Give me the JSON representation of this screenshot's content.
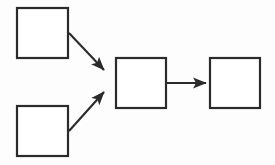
{
  "diagram": {
    "title": "",
    "background_color": "#fdfdfd",
    "stroke_color": "#2b2b2b",
    "fill_color": "#ffffff",
    "type": "flowchart",
    "nodes": [
      {
        "id": "node-top-left",
        "label": "",
        "x": 17,
        "y": 8,
        "width": 51,
        "height": 50
      },
      {
        "id": "node-bottom-left",
        "label": "",
        "x": 17,
        "y": 106,
        "width": 51,
        "height": 50
      },
      {
        "id": "node-middle",
        "label": "",
        "x": 116,
        "y": 58,
        "width": 50,
        "height": 50
      },
      {
        "id": "node-right",
        "label": "",
        "x": 210,
        "y": 58,
        "width": 50,
        "height": 50
      }
    ],
    "edges": [
      {
        "id": "edge-top-left-to-middle",
        "label": "",
        "from": "node-top-left",
        "to": "node-middle",
        "x1": 69,
        "y1": 33,
        "x2": 104,
        "y2": 70
      },
      {
        "id": "edge-bottom-left-to-middle",
        "label": "",
        "from": "node-bottom-left",
        "to": "node-middle",
        "x1": 69,
        "y1": 131,
        "x2": 104,
        "y2": 92
      },
      {
        "id": "edge-middle-to-right",
        "label": "",
        "from": "node-middle",
        "to": "node-right",
        "x1": 167,
        "y1": 83,
        "x2": 206,
        "y2": 83
      }
    ]
  }
}
